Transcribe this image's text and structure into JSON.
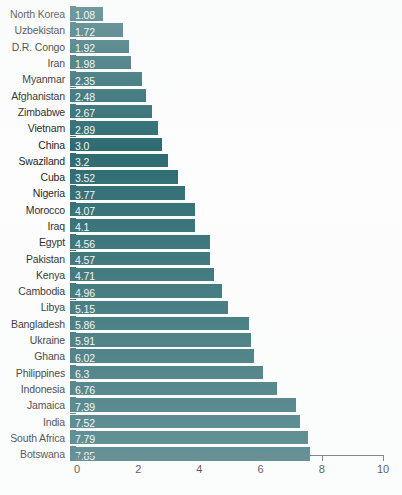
{
  "chart_data": {
    "type": "bar",
    "orientation": "horizontal",
    "title": "",
    "subtitle": "",
    "xlabel": "",
    "ylabel": "",
    "xlim": [
      0,
      10
    ],
    "xticks": [
      0,
      2,
      4,
      6,
      8,
      10
    ],
    "xtick_labels": [
      "0",
      "2",
      "4",
      "6",
      "8",
      "10"
    ],
    "grid": false,
    "legend": false,
    "bar_color": "#2e6c72",
    "value_label_color": "#eef4f4",
    "axis_color": "#555f63",
    "background_color": "#fdfdfd",
    "categories": [
      "North Korea",
      "Uzbekistan",
      "D.R. Congo",
      "Iran",
      "Myanmar",
      "Afghanistan",
      "Zimbabwe",
      "Vietnam",
      "China",
      "Swaziland",
      "Cuba",
      "Nigeria",
      "Morocco",
      "Iraq",
      "Egypt",
      "Pakistan",
      "Kenya",
      "Cambodia",
      "Libya",
      "Bangladesh",
      "Ukraine",
      "Ghana",
      "Philippines",
      "Indonesia",
      "Jamaica",
      "India",
      "South Africa",
      "Botswana"
    ],
    "values": [
      1.08,
      1.72,
      1.92,
      1.98,
      2.35,
      2.48,
      2.67,
      2.89,
      3.0,
      3.2,
      3.52,
      3.77,
      4.07,
      4.1,
      4.56,
      4.57,
      4.71,
      4.96,
      5.15,
      5.86,
      5.91,
      6.02,
      6.3,
      6.76,
      7.39,
      7.52,
      7.79,
      7.85
    ],
    "value_labels": [
      "1.08",
      "1.72",
      "1.92",
      "1.98",
      "2.35",
      "2.48",
      "2.67",
      "2.89",
      "3.0",
      "3.2",
      "3.52",
      "3.77",
      "4.07",
      "4.1",
      "4.56",
      "4.57",
      "4.71",
      "4.96",
      "5.15",
      "5.86",
      "5.91",
      "6.02",
      "6.3",
      "6.76",
      "7.39",
      "7.52",
      "7.79",
      "7.85"
    ]
  }
}
